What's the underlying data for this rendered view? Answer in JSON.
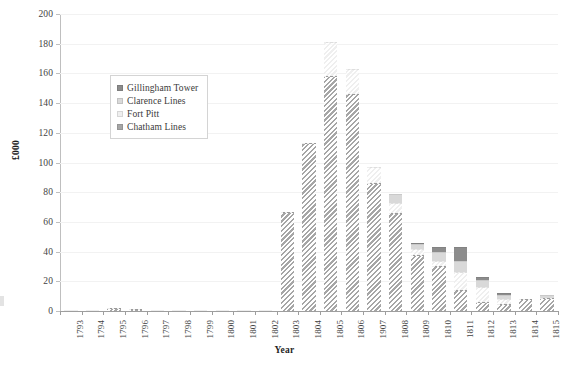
{
  "chart_data": {
    "type": "bar",
    "stacked": true,
    "title": "",
    "xlabel": "Year",
    "ylabel": "£000",
    "ylim": [
      0,
      200
    ],
    "ytick_step": 20,
    "yticks": [
      0,
      20,
      40,
      60,
      80,
      100,
      120,
      140,
      160,
      180,
      200
    ],
    "grid": true,
    "legend_position": "upper-left-inside",
    "categories": [
      "1793",
      "1794",
      "1795",
      "1796",
      "1797",
      "1798",
      "1799",
      "1800",
      "1801",
      "1802",
      "1803",
      "1804",
      "1805",
      "1806",
      "1907",
      "1808",
      "1809",
      "1810",
      "1811",
      "1812",
      "1813",
      "1814",
      "1815"
    ],
    "series": [
      {
        "name": "Chatham Lines",
        "color": "#a6a6a6",
        "pattern": "diagonal-hatch",
        "values": [
          0.4,
          0.5,
          2.2,
          1.2,
          0.4,
          0.4,
          0.4,
          0.5,
          0.5,
          1.0,
          67,
          113,
          158,
          146,
          86,
          66,
          38,
          30,
          14,
          6,
          5,
          8,
          9
        ]
      },
      {
        "name": "Fort Pitt",
        "color": "#efefef",
        "pattern": "diagonal-hatch",
        "values": [
          0,
          0,
          0,
          0,
          0,
          0,
          0,
          0,
          0,
          0,
          0,
          0,
          23,
          17,
          11,
          7,
          4,
          4,
          12,
          10,
          3,
          0,
          0
        ]
      },
      {
        "name": "Clarence Lines",
        "color": "#d9d9d9",
        "pattern": "solid",
        "values": [
          0,
          0,
          0,
          0,
          0,
          0,
          0,
          0,
          0,
          0,
          0,
          0,
          0,
          0,
          0,
          6,
          3,
          6,
          8,
          5,
          3,
          0,
          2
        ]
      },
      {
        "name": "Gillingham Tower",
        "color": "#8c8c8c",
        "pattern": "solid",
        "values": [
          0,
          0,
          0,
          0,
          0,
          0,
          0,
          0,
          0,
          0,
          0,
          0,
          0,
          0,
          0,
          0,
          1,
          3,
          9,
          2,
          1,
          0,
          0
        ]
      }
    ],
    "legend": [
      {
        "label": "Gillingham Tower",
        "color": "#8c8c8c"
      },
      {
        "label": "Clarence Lines",
        "color": "#d9d9d9"
      },
      {
        "label": "Fort Pitt",
        "color": "#efefef"
      },
      {
        "label": "Chatham Lines",
        "color": "#a6a6a6"
      }
    ]
  }
}
